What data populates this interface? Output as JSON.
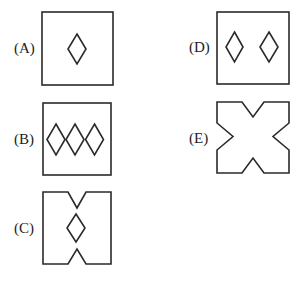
{
  "options": [
    {
      "id": "A",
      "label": "(A)",
      "description": "square containing one diamond in the center"
    },
    {
      "id": "B",
      "label": "(B)",
      "description": "square containing three diamonds in a horizontal row"
    },
    {
      "id": "C",
      "label": "(C)",
      "description": "square with V-notches at top and bottom center, one diamond between them"
    },
    {
      "id": "D",
      "label": "(D)",
      "description": "square containing two diamonds side by side"
    },
    {
      "id": "E",
      "label": "(E)",
      "description": "square with V-notches on all four sides, no diamonds"
    }
  ],
  "colors": {
    "stroke": "#2a2a2a",
    "background": "#ffffff",
    "text": "#222222"
  }
}
